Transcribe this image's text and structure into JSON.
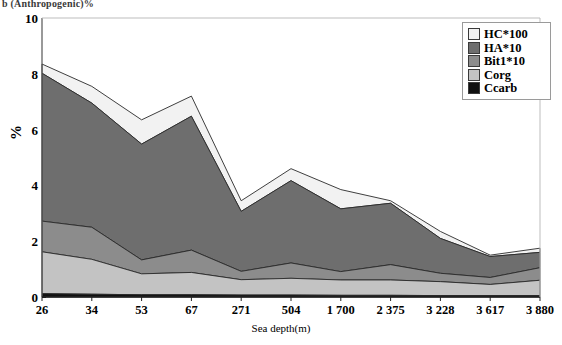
{
  "header": {
    "clipped_caption": "b (Anthropogenic)%"
  },
  "axes": {
    "ylabel": "%",
    "xlabel": "Sea depth(m)",
    "yticks": [
      "0",
      "2",
      "4",
      "6",
      "8",
      "10"
    ],
    "ylim": [
      0,
      10
    ],
    "grid": false
  },
  "legend": {
    "position": "top-right",
    "entries": [
      {
        "label": "HC*100",
        "color": "#f2f2f2"
      },
      {
        "label": "HA*10",
        "color": "#6e6e6e"
      },
      {
        "label": "Bit1*10",
        "color": "#8c8c8c"
      },
      {
        "label": "Corg",
        "color": "#c3c3c3"
      },
      {
        "label": "Ccarb",
        "color": "#101010"
      }
    ]
  },
  "chart_data": {
    "type": "area",
    "stacked": true,
    "title": "",
    "xlabel": "Sea depth(m)",
    "ylabel": "%",
    "ylim": [
      0,
      10
    ],
    "yticks": [
      0,
      2,
      4,
      6,
      8,
      10
    ],
    "categories": [
      "26",
      "34",
      "53",
      "67",
      "271",
      "504",
      "1 700",
      "2 375",
      "3 228",
      "3 617",
      "3 880"
    ],
    "series": [
      {
        "name": "Ccarb",
        "color": "#101010",
        "values": [
          0.12,
          0.1,
          0.08,
          0.08,
          0.07,
          0.07,
          0.06,
          0.06,
          0.05,
          0.05,
          0.05
        ]
      },
      {
        "name": "Corg",
        "color": "#c3c3c3",
        "values": [
          1.5,
          1.25,
          0.75,
          0.8,
          0.55,
          0.6,
          0.55,
          0.55,
          0.5,
          0.4,
          0.55
        ]
      },
      {
        "name": "Bit1*10",
        "color": "#8c8c8c",
        "values": [
          1.1,
          1.15,
          0.5,
          0.8,
          0.3,
          0.55,
          0.3,
          0.55,
          0.3,
          0.25,
          0.45
        ]
      },
      {
        "name": "HA*10",
        "color": "#6e6e6e",
        "values": [
          5.3,
          4.45,
          4.15,
          4.8,
          2.15,
          2.95,
          2.25,
          2.2,
          1.25,
          0.75,
          0.55
        ]
      },
      {
        "name": "HC*100",
        "color": "#f2f2f2",
        "values": [
          0.33,
          0.6,
          0.87,
          0.72,
          0.38,
          0.43,
          0.69,
          0.09,
          0.25,
          0.05,
          0.15
        ]
      }
    ],
    "totals": [
      8.35,
      7.55,
      6.35,
      7.2,
      3.45,
      4.6,
      3.85,
      3.45,
      2.35,
      1.5,
      1.75
    ]
  },
  "geom": {
    "plot": {
      "left": 42,
      "right": 540,
      "top": 18,
      "bottom": 297
    }
  }
}
